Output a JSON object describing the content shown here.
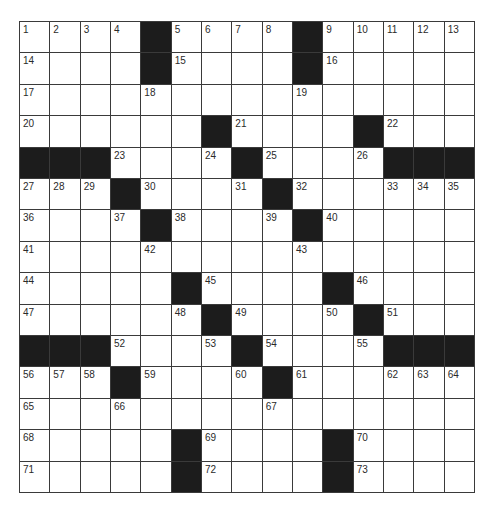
{
  "puzzle": {
    "rows": 15,
    "cols": 15,
    "colors": {
      "block": "#1c1c1c",
      "line": "#3a3a3a",
      "cell": "#ffffff",
      "number": "#2a2a2a"
    },
    "layout": [
      "....#....#.....",
      "....#....#.....",
      "...............",
      "......#....#...",
      "###....#....###",
      "...#....#......",
      "....#....#.....",
      "...............",
      ".....#....#....",
      "......#....#...",
      "###....#....###",
      "...#....#......",
      "...............",
      ".....#....#....",
      ".....#....#...."
    ],
    "numbers": [
      [
        1,
        2,
        3,
        4,
        0,
        5,
        6,
        7,
        8,
        0,
        9,
        10,
        11,
        12,
        13
      ],
      [
        14,
        0,
        0,
        0,
        0,
        15,
        0,
        0,
        0,
        0,
        16,
        0,
        0,
        0,
        0
      ],
      [
        17,
        0,
        0,
        0,
        18,
        0,
        0,
        0,
        0,
        19,
        0,
        0,
        0,
        0,
        0
      ],
      [
        20,
        0,
        0,
        0,
        0,
        0,
        0,
        21,
        0,
        0,
        0,
        0,
        22,
        0,
        0
      ],
      [
        0,
        0,
        0,
        23,
        0,
        0,
        24,
        0,
        25,
        0,
        0,
        26,
        0,
        0,
        0
      ],
      [
        27,
        28,
        29,
        0,
        30,
        0,
        0,
        31,
        0,
        32,
        0,
        0,
        33,
        34,
        35
      ],
      [
        36,
        0,
        0,
        37,
        0,
        38,
        0,
        0,
        39,
        0,
        40,
        0,
        0,
        0,
        0
      ],
      [
        41,
        0,
        0,
        0,
        42,
        0,
        0,
        0,
        0,
        43,
        0,
        0,
        0,
        0,
        0
      ],
      [
        44,
        0,
        0,
        0,
        0,
        0,
        45,
        0,
        0,
        0,
        0,
        46,
        0,
        0,
        0
      ],
      [
        47,
        0,
        0,
        0,
        0,
        48,
        0,
        49,
        0,
        0,
        50,
        0,
        51,
        0,
        0
      ],
      [
        0,
        0,
        0,
        52,
        0,
        0,
        53,
        0,
        54,
        0,
        0,
        55,
        0,
        0,
        0
      ],
      [
        56,
        57,
        58,
        0,
        59,
        0,
        0,
        60,
        0,
        61,
        0,
        0,
        62,
        63,
        64
      ],
      [
        65,
        0,
        0,
        66,
        0,
        0,
        0,
        0,
        67,
        0,
        0,
        0,
        0,
        0,
        0
      ],
      [
        68,
        0,
        0,
        0,
        0,
        0,
        69,
        0,
        0,
        0,
        0,
        70,
        0,
        0,
        0
      ],
      [
        71,
        0,
        0,
        0,
        0,
        0,
        72,
        0,
        0,
        0,
        0,
        73,
        0,
        0,
        0
      ]
    ],
    "entries": []
  }
}
